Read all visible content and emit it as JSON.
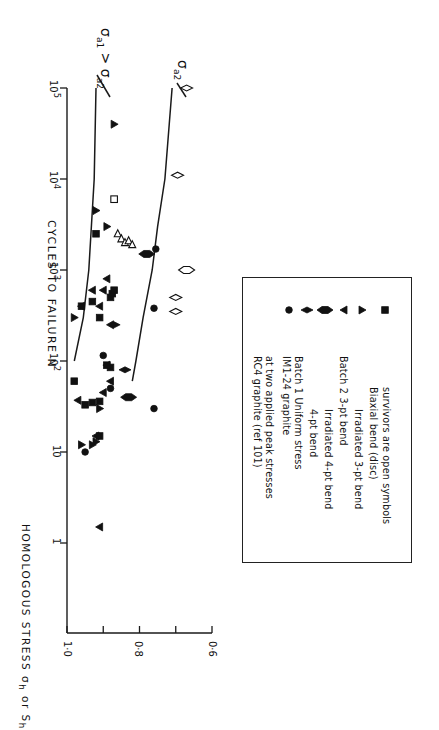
{
  "chart_data": {
    "type": "scatter",
    "orientation": "rotated 90deg clockwise on page",
    "title": "",
    "xlabel": "CYCLES TO FAILURE N",
    "ylabel": "HOMOLOGOUS STRESS σh or Sh",
    "xscale": "log",
    "xlim": [
      1,
      100000
    ],
    "ylim": [
      0.6,
      1.0
    ],
    "x_ticks": [
      "1",
      "10",
      "10^2",
      "10^3",
      "10^4",
      "10^5"
    ],
    "y_ticks": [
      "1·0",
      "0·8",
      "0·6"
    ],
    "y_minor_ticks": [
      0.9,
      0.7
    ],
    "grid": false,
    "curves": [
      {
        "name": "σa1 > σa2",
        "label": "σa1 > σa2",
        "points": [
          [
            100,
            0.98
          ],
          [
            300,
            0.955
          ],
          [
            1000,
            0.94
          ],
          [
            10000,
            0.925
          ],
          [
            100000,
            0.92
          ]
        ]
      },
      {
        "name": "σa2",
        "label": "σa2",
        "points": [
          [
            60,
            0.82
          ],
          [
            100,
            0.81
          ],
          [
            300,
            0.79
          ],
          [
            1000,
            0.765
          ],
          [
            3000,
            0.75
          ],
          [
            10000,
            0.73
          ],
          [
            100000,
            0.71
          ]
        ]
      }
    ],
    "series": [
      {
        "name": "Batch 1 Uniform stress",
        "marker": "circle",
        "filled": true,
        "points": [
          [
            10,
            0.95
          ],
          [
            30,
            0.76
          ],
          [
            50,
            0.88
          ],
          [
            115,
            0.9
          ],
          [
            380,
            0.76
          ],
          [
            1700,
            0.755
          ]
        ]
      },
      {
        "name": "Batch 1 4-pt bend",
        "marker": "diamond",
        "filled": true,
        "points": [
          [
            80,
            0.84
          ],
          [
            250,
            0.87
          ]
        ]
      },
      {
        "name": "Batch 1 Irradiated 4-pt bend",
        "marker": "fat-diamond",
        "filled": true,
        "points": [
          [
            40,
            0.83
          ],
          [
            1500,
            0.78
          ]
        ]
      },
      {
        "name": "Batch 2 3-pt bend",
        "marker": "triangle-left",
        "filled": true,
        "points": [
          [
            1.5,
            0.91
          ],
          [
            15,
            0.92
          ],
          [
            37,
            0.97
          ],
          [
            45,
            0.9
          ],
          [
            60,
            0.88
          ],
          [
            90,
            0.89
          ],
          [
            400,
            0.96
          ],
          [
            400,
            0.91
          ],
          [
            600,
            0.9
          ],
          [
            600,
            0.93
          ],
          [
            800,
            0.89
          ],
          [
            250,
            0.88
          ]
        ]
      },
      {
        "name": "Batch 2 Irradiated 3-pt bend",
        "marker": "triangle-right",
        "filled": true,
        "points": [
          [
            12,
            0.96
          ],
          [
            12,
            0.93
          ],
          [
            13,
            0.92
          ],
          [
            30,
            0.91
          ],
          [
            300,
            0.98
          ],
          [
            3000,
            0.89
          ],
          [
            4500,
            0.92
          ],
          [
            40000,
            0.87
          ]
        ]
      },
      {
        "name": "Biaxial bend (disc)",
        "marker": "square",
        "filled": true,
        "points": [
          [
            15,
            0.91
          ],
          [
            33,
            0.95
          ],
          [
            35,
            0.93
          ],
          [
            36,
            0.91
          ],
          [
            60,
            0.98
          ],
          [
            85,
            0.88
          ],
          [
            90,
            0.89
          ],
          [
            300,
            0.91
          ],
          [
            400,
            0.96
          ],
          [
            450,
            0.93
          ],
          [
            500,
            0.88
          ],
          [
            550,
            0.875
          ],
          [
            600,
            0.87
          ],
          [
            2500,
            0.92
          ]
        ]
      },
      {
        "name": "Survivors (open symbols)",
        "marker": "open",
        "filled": false,
        "points": [
          {
            "N": 6000,
            "s": 0.87,
            "marker": "square"
          },
          {
            "N": 2500,
            "s": 0.86,
            "marker": "triangle-up"
          },
          {
            "N": 2200,
            "s": 0.85,
            "marker": "triangle-up"
          },
          {
            "N": 2000,
            "s": 0.84,
            "marker": "triangle-up"
          },
          {
            "N": 2100,
            "s": 0.83,
            "marker": "triangle-up"
          },
          {
            "N": 1900,
            "s": 0.82,
            "marker": "triangle-up"
          },
          {
            "N": 100000,
            "s": 0.67,
            "marker": "diamond"
          },
          {
            "N": 11000,
            "s": 0.695,
            "marker": "diamond"
          },
          {
            "N": 1000,
            "s": 0.67,
            "marker": "fat-diamond"
          },
          {
            "N": 500,
            "s": 0.7,
            "marker": "diamond"
          },
          {
            "N": 350,
            "s": 0.7,
            "marker": "diamond"
          }
        ]
      }
    ],
    "legend": {
      "position": "inside lower-right",
      "entries": [
        {
          "text": "RC4 graphite  (ref 101)",
          "symbol": ""
        },
        {
          "text": "at two applied peak stresses",
          "symbol": "line"
        },
        {
          "text": "IM1-24 graphite",
          "symbol": ""
        },
        {
          "text": "Batch 1  Uniform  stress",
          "symbol": "circle"
        },
        {
          "text": "4-pt bend",
          "symbol": "diamond"
        },
        {
          "text": "Irradiated 4-pt bend",
          "symbol": "fat-diamond"
        },
        {
          "text": "Batch 2 3-pt  bend",
          "symbol": "triangle-left"
        },
        {
          "text": "Irradiated 3-pt bend",
          "symbol": "triangle-right"
        },
        {
          "text": "Biaxial bend (disc)",
          "symbol": "square"
        },
        {
          "text": "survivors are open symbols",
          "symbol": ""
        }
      ]
    }
  },
  "labels": {
    "x_axis_title": "CYCLES TO FAILURE N",
    "y_axis_title": "HOMOLOGOUS STRESS σ",
    "y_axis_title_sub1": "h",
    "y_axis_title_mid": " or S",
    "y_axis_title_sub2": "h",
    "curve1_label_a": "σ",
    "curve1_label_a_sub": "a1",
    "curve1_label_gt": " > σ",
    "curve1_label_b_sub": "a2",
    "curve2_label": "σ",
    "curve2_label_sub": "a2",
    "legend_lines": {
      "l1": "RC4 graphite  (ref 101)",
      "l2": "at two applied peak stresses",
      "l3": "IM1-24 graphite",
      "l4": "Batch 1   Uniform  stress",
      "l5": "4-pt  bend",
      "l6": "Irradiated  4-pt  bend",
      "l7": "Batch 2  3-pt  bend",
      "l8": "Irradiated  3-pt  bend",
      "l9": "Biaxial  bend  (disc)",
      "l10": "survivors  are  open  symbols"
    },
    "x_tick_labels": [
      "1",
      "10",
      "10",
      "10",
      "10",
      "10"
    ],
    "x_tick_exps": [
      "",
      "",
      "2",
      "3",
      "4",
      "5"
    ],
    "y_tick_labels": [
      "1·0",
      "0·8",
      "0·6"
    ]
  }
}
